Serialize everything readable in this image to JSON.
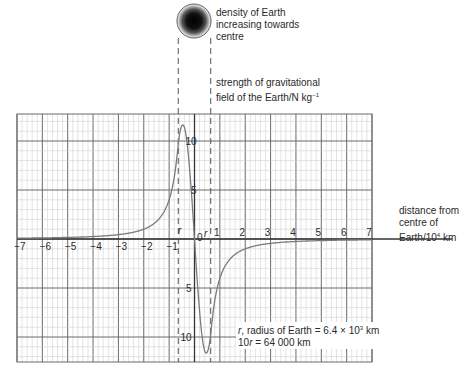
{
  "chart_data": {
    "type": "line",
    "ylabel": "strength of gravitational field of the Earth/N kg⁻¹",
    "xlabel": "distance from centre of Earth/10⁴ km",
    "xlim": [
      -7,
      7
    ],
    "ylim": [
      -12.5,
      12.75
    ],
    "grid": true,
    "x_ticks": [
      -7,
      -6,
      -5,
      -4,
      -3,
      -2,
      -1,
      1,
      2,
      3,
      4,
      5,
      6,
      7
    ],
    "x_tick_labels": [
      "−7",
      "−6",
      "−5",
      "−4",
      "−3",
      "−2",
      "−1",
      "1",
      "2",
      "3",
      "4",
      "5",
      "6",
      "7"
    ],
    "y_ticks_upper": [
      10,
      5
    ],
    "y_ticks_lower": [
      5,
      10
    ],
    "origin_label": "0",
    "radius_marker_label": "r",
    "radius_of_earth_x": 0.64,
    "series": [
      {
        "name": "g",
        "x": [
          -7,
          -6,
          -5,
          -4,
          -3,
          -2,
          -1.5,
          -1,
          -0.8,
          -0.64,
          -0.53,
          -0.4,
          -0.2,
          0,
          0.2,
          0.4,
          0.49,
          0.64,
          0.8,
          1,
          1.5,
          2,
          3,
          4,
          5,
          6,
          7
        ],
        "values": [
          0.08,
          0.11,
          0.16,
          0.25,
          0.44,
          1.0,
          1.8,
          4.0,
          6.3,
          9.8,
          11.0,
          9.5,
          5.0,
          0,
          -5.0,
          -9.5,
          -11.0,
          -9.8,
          -6.3,
          -4.0,
          -1.8,
          -1.0,
          -0.44,
          -0.25,
          -0.16,
          -0.11,
          -0.08
        ]
      }
    ],
    "annotations": [
      "density of Earth increasing towards centre",
      "r, radius of Earth = 6.4 × 10³ km",
      "10r = 64 000 km"
    ]
  },
  "labels": {
    "density_line1": "density of Earth",
    "density_line2": "increasing towards",
    "density_line3": "centre",
    "yaxis_line1": "strength of gravitational",
    "yaxis_line2": "field of the Earth/N kg",
    "yaxis_sup": "−1",
    "xaxis_line1": "distance from",
    "xaxis_line2": "centre of",
    "xaxis_line3_pre": "Earth/10",
    "xaxis_sup": "4",
    "xaxis_line3_post": " km",
    "radius_note_pre": "r",
    "radius_note_mid": ", radius of Earth = 6.4 × 10",
    "radius_note_sup": "3",
    "radius_note_post": " km",
    "ten_r_note_pre": "10",
    "ten_r_note_r": "r",
    "ten_r_note_post": " = 64 000 km",
    "r_left": "r",
    "r_right": "r",
    "zero": "0"
  },
  "colors": {
    "grid_minor": "#c8c8c8",
    "grid_major": "#6a6a6a",
    "axis": "#333333",
    "curve": "#7a7a7a",
    "dashed": "#555555"
  }
}
